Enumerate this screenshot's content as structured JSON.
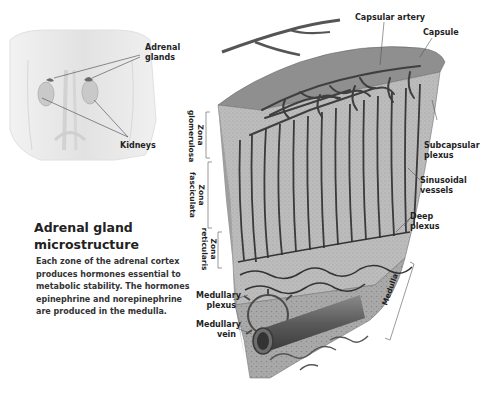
{
  "title": {
    "line1": "Adrenal gland",
    "line2": "microstructure"
  },
  "description": [
    "Each zone of the adrenal cortex",
    "produces hormones essential to",
    "metabolic stability. The hormones",
    "epinephrine and norepinephrine",
    "are produced in the medulla."
  ],
  "torso_labels": {
    "adrenal_glands": [
      "Adrenal",
      "glands"
    ],
    "kidneys": "Kidneys"
  },
  "block_labels": {
    "capsular_artery": "Capsular artery",
    "capsule": "Capsule",
    "subcapsular_plexus": [
      "Subcapsular",
      "plexus"
    ],
    "sinusoidal_vessels": [
      "Sinusoidal",
      "vessels"
    ],
    "deep_plexus": [
      "Deep",
      "plexus"
    ],
    "medulla": "Medulla",
    "medullary_plexus": [
      "Medullary",
      "plexus"
    ],
    "medullary_vein": [
      "Medullary",
      "vein"
    ]
  },
  "zone_labels": {
    "glomerulosa": [
      "Zona",
      "glomerulosa"
    ],
    "fasciculata": [
      "Zona",
      "fasciculata"
    ],
    "reticularis": [
      "Zona",
      "reticularis"
    ]
  },
  "colors": {
    "tissue": "#b8b8b8",
    "capsule": "#8a8a8a",
    "vessel": "#3c3c3c",
    "torso": "#e6e6e6"
  }
}
